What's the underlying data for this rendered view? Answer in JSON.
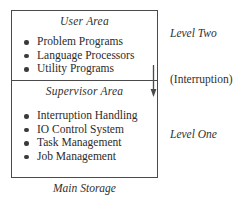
{
  "diagram": {
    "caption": "Main Storage",
    "colors": {
      "border": "#4a4a4a",
      "text": "#2b2b2b",
      "bullet": "#3a3a3a",
      "background": "#ffffff"
    },
    "areas": [
      {
        "title": "User Area",
        "items": [
          "Problem Programs",
          "Language Processors",
          "Utility Programs"
        ]
      },
      {
        "title": "Supervisor Area",
        "items": [
          "Interruption Handling",
          "IO Control System",
          "Task Management",
          "Job Management"
        ]
      }
    ],
    "side_labels": {
      "level_two": "Level Two",
      "interruption": "(Interruption)",
      "level_one": "Level One"
    }
  }
}
